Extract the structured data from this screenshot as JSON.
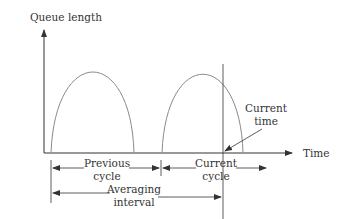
{
  "diagram": {
    "y_axis_label": "Queue length",
    "x_axis_label": "Time",
    "current_time_label": [
      "Current",
      "time"
    ],
    "previous_cycle_label": [
      "Previous",
      "cycle"
    ],
    "current_cycle_label": [
      "Current",
      "cycle"
    ],
    "averaging_interval_label": [
      "Averaging",
      "interval"
    ],
    "colors": {
      "axis": "#333333",
      "curve": "#8a8a8a",
      "text": "#333333"
    }
  }
}
